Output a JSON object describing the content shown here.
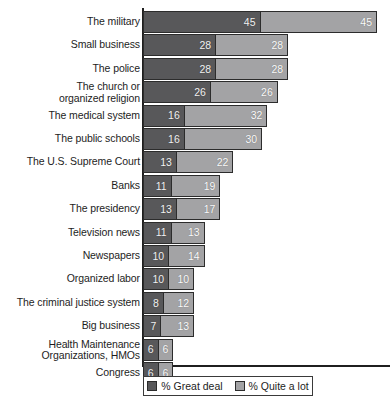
{
  "chart_data": {
    "type": "bar",
    "orientation": "horizontal",
    "stacked": true,
    "title": "",
    "subtitle": "",
    "xlabel": "",
    "ylabel": "",
    "xlim": [
      0,
      90
    ],
    "grid": false,
    "legend_position": "bottom",
    "categories": [
      "The military",
      "Small business",
      "The police",
      "The church or\norganized religion",
      "The medical system",
      "The public schools",
      "The U.S. Supreme Court",
      "Banks",
      "The presidency",
      "Television news",
      "Newspapers",
      "Organized labor",
      "The criminal justice system",
      "Big business",
      "Health Maintenance\nOrganizations, HMOs",
      "Congress"
    ],
    "series": [
      {
        "name": "% Great deal",
        "color": "#58585a",
        "values": [
          45,
          28,
          28,
          26,
          16,
          16,
          13,
          11,
          13,
          11,
          10,
          10,
          8,
          7,
          6,
          6
        ]
      },
      {
        "name": "% Quite a lot",
        "color": "#a3a3a5",
        "values": [
          45,
          28,
          28,
          26,
          32,
          30,
          22,
          19,
          17,
          13,
          14,
          10,
          12,
          13,
          6,
          6
        ]
      }
    ],
    "totals": [
      90,
      56,
      56,
      52,
      48,
      46,
      35,
      30,
      30,
      24,
      24,
      20,
      20,
      20,
      12,
      12
    ]
  },
  "legend": {
    "items": [
      {
        "label": "% Great deal",
        "swatch": "great"
      },
      {
        "label": "% Quite a lot",
        "swatch": "quite"
      }
    ]
  }
}
